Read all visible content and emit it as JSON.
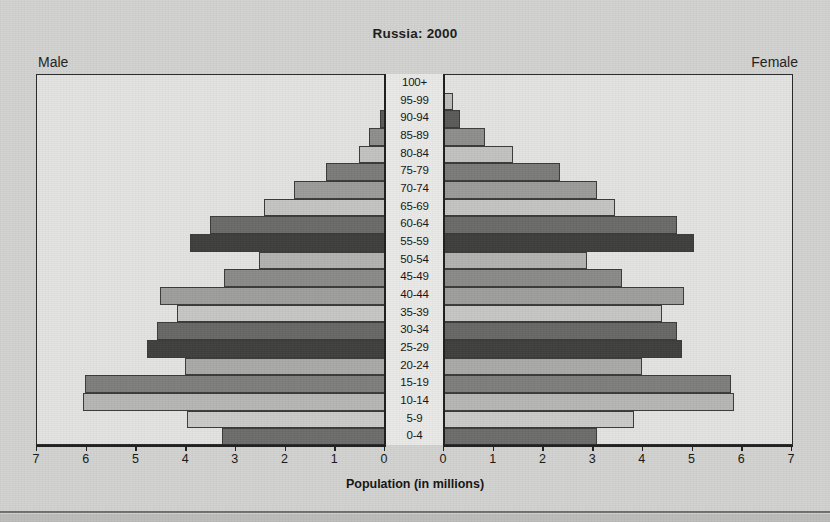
{
  "chart_title": "Russia: 2000",
  "male_label": "Male",
  "female_label": "Female",
  "x_axis_title": "Population (in millions)",
  "chart_data": {
    "type": "bar",
    "subtype": "population-pyramid",
    "title": "Russia: 2000",
    "xlabel": "Population (in millions)",
    "ylabel": "",
    "xlim": [
      0,
      7
    ],
    "grid": false,
    "legend_position": "none",
    "categories": [
      "100+",
      "95-99",
      "90-94",
      "85-89",
      "80-84",
      "75-79",
      "70-74",
      "65-69",
      "60-64",
      "55-59",
      "50-54",
      "45-49",
      "40-44",
      "35-39",
      "30-34",
      "25-29",
      "20-24",
      "15-19",
      "10-14",
      "5-9",
      "0-4"
    ],
    "x_ticks_male": [
      "7",
      "6",
      "5",
      "4",
      "3",
      "2",
      "1",
      "0"
    ],
    "x_ticks_female": [
      "0",
      "1",
      "2",
      "3",
      "4",
      "5",
      "6",
      "7"
    ],
    "series": [
      {
        "name": "Male",
        "side": "left",
        "values": [
          0.02,
          0.05,
          0.12,
          0.35,
          0.55,
          1.2,
          1.85,
          2.45,
          3.55,
          3.95,
          2.55,
          3.25,
          4.55,
          4.2,
          4.6,
          4.8,
          4.05,
          6.05,
          6.1,
          4.0,
          3.3
        ]
      },
      {
        "name": "Female",
        "side": "right",
        "values": [
          0.03,
          0.2,
          0.35,
          0.85,
          1.4,
          2.35,
          3.1,
          3.45,
          4.7,
          5.05,
          2.9,
          3.6,
          4.85,
          4.4,
          4.7,
          4.8,
          4.0,
          5.8,
          5.85,
          3.85,
          3.1
        ]
      }
    ],
    "shades": [
      "#888886",
      "#bdbdbb",
      "#5a5a58",
      "#8e8e8c",
      "#c2c2c0",
      "#7b7b79",
      "#9b9b99",
      "#c4c4c2",
      "#6a6a68",
      "#3e3e3c",
      "#b2b2b0",
      "#8a8a88",
      "#9e9e9c",
      "#c6c6c4",
      "#676765",
      "#3f3f3d",
      "#a9a9a7",
      "#7e7e7c",
      "#b6b6b4",
      "#cacac8",
      "#6c6c6a"
    ]
  }
}
